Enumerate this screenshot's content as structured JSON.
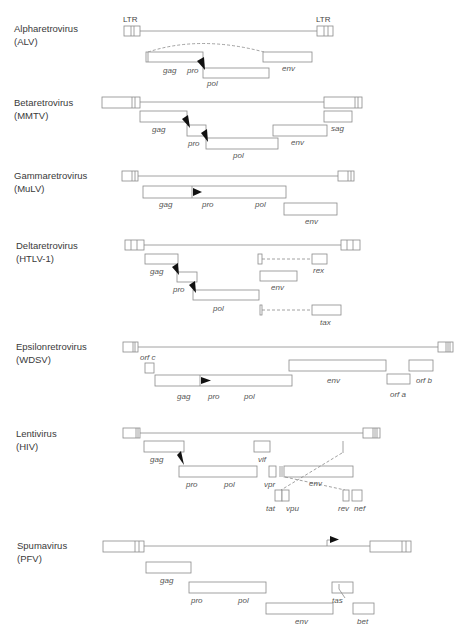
{
  "figure": {
    "colors": {
      "line": "#8a8a8a",
      "text": "#3a3a3a",
      "gene_text": "#555555",
      "frameshift_marker": "#111111",
      "background": "#ffffff"
    }
  },
  "ltr_labels": {
    "left": "LTR",
    "right": "LTR"
  },
  "genera": [
    {
      "id": "alpha",
      "name": "Alpharetrovirus",
      "abbrev": "(ALV)",
      "genes": {
        "gag": "gag",
        "pro": "pro",
        "pol": "pol",
        "env": "env"
      },
      "features": [
        "splice-dashed-arc gag-to-env",
        "frameshift-marker gag/pro-pol"
      ]
    },
    {
      "id": "beta",
      "name": "Betaretrovirus",
      "abbrev": "(MMTV)",
      "genes": {
        "gag": "gag",
        "pro": "pro",
        "pol": "pol",
        "env": "env",
        "sag": "sag"
      },
      "features": [
        "frameshift-marker gag-pro",
        "frameshift-marker pro-pol"
      ]
    },
    {
      "id": "gamma",
      "name": "Gammaretrovirus",
      "abbrev": "(MuLV)",
      "genes": {
        "gag": "gag",
        "pro": "pro",
        "pol": "pol",
        "env": "env"
      },
      "features": [
        "readthrough-marker gag/pro"
      ]
    },
    {
      "id": "delta",
      "name": "Deltaretrovirus",
      "abbrev": "(HTLV-1)",
      "genes": {
        "gag": "gag",
        "pro": "pro",
        "pol": "pol",
        "env": "env",
        "rex": "rex",
        "tax": "tax"
      },
      "features": [
        "frameshift-marker gag-pro",
        "frameshift-marker pro-pol",
        "spliced rex",
        "spliced tax"
      ]
    },
    {
      "id": "epsilon",
      "name": "Epsilonretrovirus",
      "abbrev": "(WDSV)",
      "genes": {
        "orf_c": "orf c",
        "gag": "gag",
        "pro": "pro",
        "pol": "pol",
        "env": "env",
        "orf_a": "orf a",
        "orf_b": "orf b"
      },
      "features": [
        "readthrough-marker gag/pro"
      ]
    },
    {
      "id": "lenti",
      "name": "Lentivirus",
      "abbrev": "(HIV)",
      "genes": {
        "gag": "gag",
        "pro": "pro",
        "pol": "pol",
        "vif": "vif",
        "vpr": "vpr",
        "env": "env",
        "tat": "tat",
        "vpu": "vpu",
        "rev": "rev",
        "nef": "nef"
      },
      "features": [
        "frameshift-marker gag/pro-pol",
        "spliced tat",
        "spliced rev"
      ]
    },
    {
      "id": "spuma",
      "name": "Spumavirus",
      "abbrev": "(PFV)",
      "genes": {
        "gag": "gag",
        "pro": "pro",
        "pol": "pol",
        "env": "env",
        "tas": "tas",
        "bet": "bet"
      },
      "features": [
        "internal-promoter arrow",
        "spliced bet"
      ]
    }
  ]
}
